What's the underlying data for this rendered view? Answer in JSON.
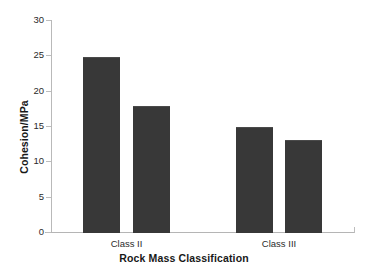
{
  "chart_data": {
    "type": "bar",
    "title": "",
    "xlabel": "Rock Mass Classification",
    "ylabel": "Cohesion/MPa",
    "categories": [
      "Class II",
      "Class III"
    ],
    "series": [
      {
        "name": "Series 1",
        "values": [
          24.8,
          14.9
        ]
      },
      {
        "name": "Series 2",
        "values": [
          17.8,
          13.0
        ]
      }
    ],
    "ylim": [
      0,
      30
    ],
    "ytick_labels": [
      "0",
      "5",
      "10",
      "15",
      "20",
      "25",
      "30"
    ],
    "ytick_values": [
      0,
      5,
      10,
      15,
      20,
      25,
      30
    ],
    "grid": false,
    "legend": "none",
    "bar_color": "#383838",
    "axis_color": "#b9b9b9",
    "background_color": "#ffffff",
    "bars": [
      {
        "label": "Class II bar 1",
        "value": 24.8
      },
      {
        "label": "Class II bar 2",
        "value": 17.8
      },
      {
        "label": "Class III bar 1",
        "value": 14.9
      },
      {
        "label": "Class III bar 2",
        "value": 13.0
      }
    ]
  }
}
